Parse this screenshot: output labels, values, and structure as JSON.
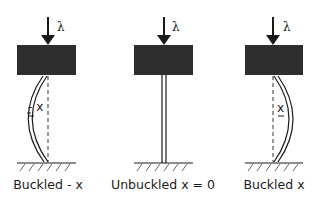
{
  "diagram": {
    "colors": {
      "block": "#2e2e2e",
      "line": "#1a1a1a",
      "dashed": "#333333",
      "background": "#ffffff"
    },
    "panels": [
      {
        "id": "buckled-left",
        "load_symbol": "λ",
        "displacement_label": "- x",
        "caption": "Buckled - x",
        "deflection": "left"
      },
      {
        "id": "unbuckled",
        "load_symbol": "λ",
        "displacement_label": "",
        "caption": "Unbuckled x = 0",
        "deflection": "none"
      },
      {
        "id": "buckled-right",
        "load_symbol": "λ",
        "displacement_label": "x",
        "caption": "Buckled x",
        "deflection": "right"
      }
    ]
  }
}
